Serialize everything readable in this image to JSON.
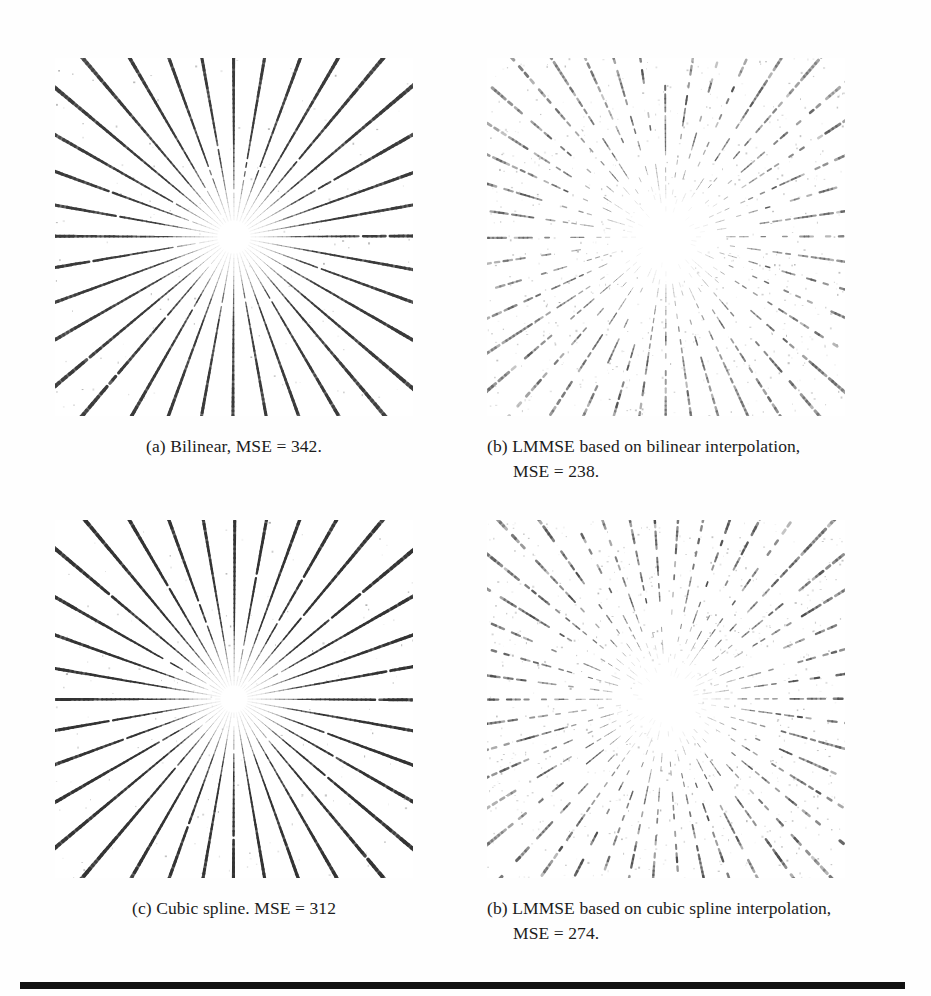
{
  "figure": {
    "panels": [
      {
        "id": "a",
        "caption": "(a) Bilinear, MSE = 342.",
        "caption_lines": [
          "(a) Bilinear, MSE = 342."
        ],
        "label": "(a)",
        "method": "Bilinear",
        "mse": 342,
        "caption_style": "centered",
        "pattern": {
          "type": "siemens-star",
          "spokes": 36,
          "render": "solid",
          "stroke": "#3a3a3a",
          "max_darkness": 0.88,
          "hub_radius": 17,
          "speckle": 0.05
        }
      },
      {
        "id": "b",
        "caption": "(b) LMMSE based on bilinear interpolation, MSE = 238.",
        "caption_lines": [
          "(b) LMMSE based on bilinear interpolation,",
          "MSE = 238."
        ],
        "label": "(b)",
        "method": "LMMSE based on bilinear interpolation",
        "mse": 238,
        "caption_style": "hanging",
        "pattern": {
          "type": "siemens-star",
          "spokes": 44,
          "render": "dotted",
          "stroke": "#555555",
          "max_darkness": 0.62,
          "hub_radius": 26,
          "speckle": 0.22
        }
      },
      {
        "id": "c",
        "caption": "(c) Cubic spline. MSE = 312",
        "caption_lines": [
          "(c) Cubic spline. MSE = 312"
        ],
        "label": "(c)",
        "method": "Cubic spline",
        "mse": 312,
        "caption_style": "centered",
        "pattern": {
          "type": "siemens-star",
          "spokes": 36,
          "render": "solid",
          "stroke": "#333333",
          "max_darkness": 0.93,
          "hub_radius": 14,
          "speckle": 0.07
        }
      },
      {
        "id": "d",
        "caption": "(b) LMMSE based on cubic spline interpolation, MSE = 274.",
        "caption_lines": [
          "(b) LMMSE based on cubic spline interpolation,",
          "MSE = 274."
        ],
        "label": "(b)",
        "method": "LMMSE based on cubic spline interpolation",
        "mse": 274,
        "caption_style": "hanging",
        "pattern": {
          "type": "siemens-star",
          "spokes": 46,
          "render": "dotted",
          "stroke": "#4e4e4e",
          "max_darkness": 0.66,
          "hub_radius": 24,
          "speckle": 0.26
        }
      }
    ]
  },
  "rule": {
    "color": "#111111"
  }
}
